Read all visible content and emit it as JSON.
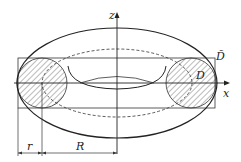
{
  "diagram": {
    "type": "torus-cross-section",
    "labels": {
      "z_axis": "z",
      "x_axis": "x",
      "outer_box": "D̃",
      "circle": "D",
      "minor_radius": "r",
      "major_radius": "R"
    },
    "colors": {
      "stroke": "#222222",
      "hatch": "#555555",
      "background": "#ffffff"
    }
  }
}
